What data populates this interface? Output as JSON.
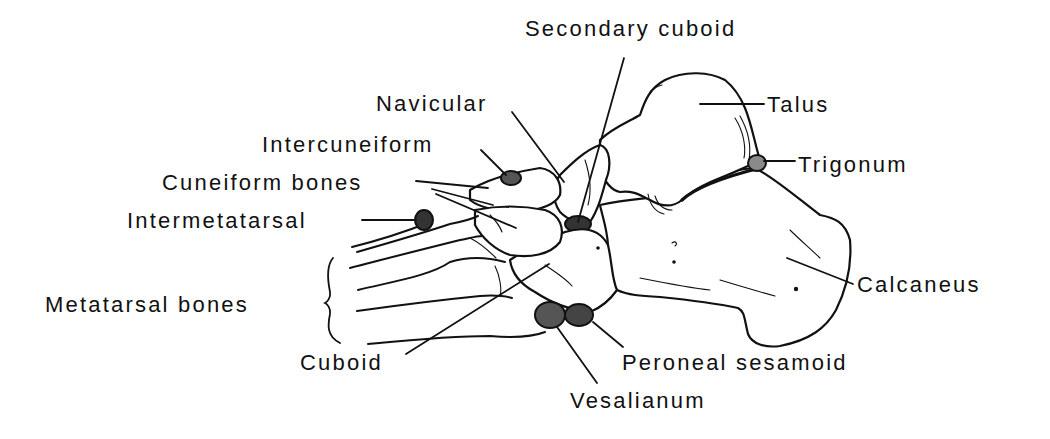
{
  "figure": {
    "background_color": "#ffffff",
    "ink_color": "#111111"
  },
  "labels": {
    "secondary_cuboid": "Secondary cuboid",
    "navicular": "Navicular",
    "talus": "Talus",
    "trigonum": "Trigonum",
    "intercuneiform": "Intercuneiform",
    "cuneiform_bones": "Cuneiform bones",
    "intermetatarsal": "Intermetatarsal",
    "metatarsal_bones": "Metatarsal bones",
    "cuboid": "Cuboid",
    "calcaneus": "Calcaneus",
    "peroneal_sesamoid": "Peroneal sesamoid",
    "vesalianum": "Vesalianum"
  }
}
